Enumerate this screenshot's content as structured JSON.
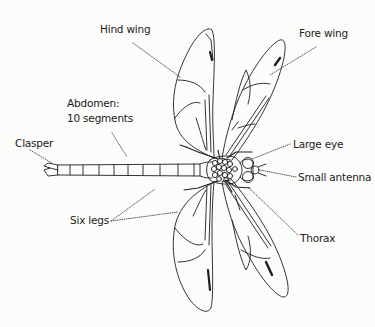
{
  "diagram": {
    "labels": {
      "hind_wing": "Hind wing",
      "fore_wing": "Fore wing",
      "abdomen_line1": "Abdomen:",
      "abdomen_line2": "10 segments",
      "clasper": "Clasper",
      "large_eye": "Large eye",
      "small_antenna": "Small antenna",
      "six_legs": "Six legs",
      "thorax": "Thorax"
    },
    "colors": {
      "background": "#fcfcfa",
      "line": "#1e1e1e",
      "text": "#222222"
    }
  }
}
